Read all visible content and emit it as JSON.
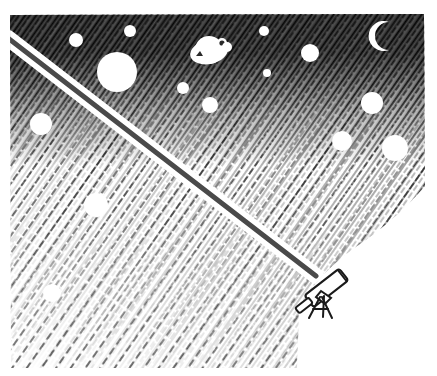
{
  "artwork": {
    "title": "Night Sky Observed Through a Telescope",
    "medium": "pen-and-ink cross-hatch drawing",
    "style": "hand-drawn hatching, high contrast black and white",
    "canvas": {
      "width": 437,
      "height": 376
    },
    "background_color": "#ffffff",
    "ink_color": "#111111"
  },
  "sky": {
    "name": "hatched-night-sky",
    "description": "Dense diagonal cross-hatching darkest at the top edge fading to sparse light hatching toward the lower left",
    "gradient": {
      "darkest_edge": "top",
      "lightest_edge": "bottom-left",
      "stops": [
        {
          "position": 0.0,
          "darkness": 1.0
        },
        {
          "position": 0.22,
          "darkness": 0.82
        },
        {
          "position": 0.45,
          "darkness": 0.5
        },
        {
          "position": 0.7,
          "darkness": 0.28
        },
        {
          "position": 1.0,
          "darkness": 0.16
        }
      ]
    },
    "hatch_angle_degrees": -55,
    "region": {
      "top": 14,
      "left": 10,
      "right": 426,
      "bottom": 368,
      "bottom_right_cutout": true,
      "cutout_description": "Large concave curved white area sweeping in from the lower right corner, meeting the flat bottom edge near x=295"
    }
  },
  "beam": {
    "name": "telescope-sight-line",
    "description": "Straight dark gray beam with white halo margins running from the telescope eyepiece at lower right up to the upper left corner",
    "color": "#4a4a4a",
    "halo_color": "#ffffff",
    "thickness_px": 5,
    "halo_thickness_px": 16,
    "start": {
      "x": 316,
      "y": 276
    },
    "end": {
      "x": 8,
      "y": 38
    }
  },
  "telescope": {
    "name": "telescope",
    "label": "refracting telescope on tripod",
    "position": {
      "x": 322,
      "y": 292
    },
    "tube": {
      "angle_degrees": -38,
      "length_px": 52,
      "body_color": "#ffffff",
      "outline_color": "#1a1a1a"
    },
    "parts": [
      {
        "name": "eyepiece",
        "label": "eyepiece"
      },
      {
        "name": "tube",
        "label": "optical tube"
      },
      {
        "name": "objective-end",
        "label": "objective lens end"
      },
      {
        "name": "mount-head",
        "label": "mount head"
      },
      {
        "name": "tripod",
        "label": "tripod legs"
      }
    ]
  },
  "celestial_objects": [
    {
      "name": "star",
      "id": "star-01",
      "cx": 76,
      "cy": 40,
      "r": 7,
      "shape": "circle"
    },
    {
      "name": "star",
      "id": "star-02",
      "cx": 130,
      "cy": 31,
      "r": 6,
      "shape": "circle"
    },
    {
      "name": "star",
      "id": "star-03",
      "cx": 117,
      "cy": 72,
      "r": 20,
      "shape": "circle"
    },
    {
      "name": "planet-with-ring",
      "id": "planet-01",
      "cx": 209,
      "cy": 52,
      "r": 16,
      "shape": "ringed"
    },
    {
      "name": "star",
      "id": "star-04",
      "cx": 227,
      "cy": 47,
      "r": 5,
      "shape": "circle"
    },
    {
      "name": "star",
      "id": "star-05",
      "cx": 264,
      "cy": 31,
      "r": 5,
      "shape": "circle"
    },
    {
      "name": "star",
      "id": "star-06",
      "cx": 267,
      "cy": 73,
      "r": 4,
      "shape": "circle"
    },
    {
      "name": "star",
      "id": "star-07",
      "cx": 183,
      "cy": 88,
      "r": 6,
      "shape": "circle"
    },
    {
      "name": "star",
      "id": "star-08",
      "cx": 210,
      "cy": 105,
      "r": 8,
      "shape": "circle"
    },
    {
      "name": "star",
      "id": "star-09",
      "cx": 310,
      "cy": 53,
      "r": 9,
      "shape": "circle"
    },
    {
      "name": "crescent-moon",
      "id": "moon-01",
      "cx": 378,
      "cy": 36,
      "r": 15,
      "shape": "crescent"
    },
    {
      "name": "star",
      "id": "star-10",
      "cx": 372,
      "cy": 103,
      "r": 11,
      "shape": "circle"
    },
    {
      "name": "star",
      "id": "star-11",
      "cx": 342,
      "cy": 141,
      "r": 10,
      "shape": "circle"
    },
    {
      "name": "star",
      "id": "star-12",
      "cx": 395,
      "cy": 148,
      "r": 13,
      "shape": "circle"
    },
    {
      "name": "star",
      "id": "star-13",
      "cx": 41,
      "cy": 124,
      "r": 11,
      "shape": "circle"
    },
    {
      "name": "star",
      "id": "star-14",
      "cx": 96,
      "cy": 205,
      "r": 12,
      "shape": "circle"
    },
    {
      "name": "star",
      "id": "star-15",
      "cx": 52,
      "cy": 293,
      "r": 9,
      "shape": "circle"
    }
  ]
}
